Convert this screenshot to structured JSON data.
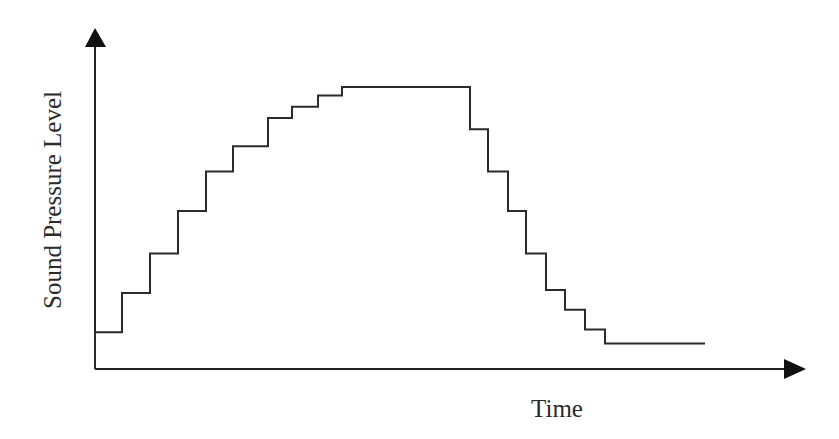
{
  "chart_data": {
    "type": "line",
    "subtype": "step",
    "title": "",
    "xlabel": "Time",
    "ylabel": "Sound Pressure Level",
    "grid": false,
    "legend": null,
    "ticks": {
      "x": [],
      "y": []
    },
    "units": "relative (0 = time axis, 10 = peak plateau)",
    "ylim": [
      0,
      11
    ],
    "series": [
      {
        "name": "Sound Pressure Level",
        "steps": [
          {
            "x_start": 95,
            "x_end": 122,
            "level": 1.3
          },
          {
            "x_start": 122,
            "x_end": 150,
            "level": 2.7
          },
          {
            "x_start": 150,
            "x_end": 178,
            "level": 4.1
          },
          {
            "x_start": 178,
            "x_end": 206,
            "level": 5.6
          },
          {
            "x_start": 206,
            "x_end": 233,
            "level": 7.0
          },
          {
            "x_start": 233,
            "x_end": 268,
            "level": 7.9
          },
          {
            "x_start": 268,
            "x_end": 292,
            "level": 8.9
          },
          {
            "x_start": 292,
            "x_end": 318,
            "level": 9.3
          },
          {
            "x_start": 318,
            "x_end": 342,
            "level": 9.7
          },
          {
            "x_start": 342,
            "x_end": 470,
            "level": 10.0
          },
          {
            "x_start": 470,
            "x_end": 488,
            "level": 8.5
          },
          {
            "x_start": 488,
            "x_end": 508,
            "level": 7.0
          },
          {
            "x_start": 508,
            "x_end": 526,
            "level": 5.6
          },
          {
            "x_start": 526,
            "x_end": 546,
            "level": 4.1
          },
          {
            "x_start": 546,
            "x_end": 565,
            "level": 2.8
          },
          {
            "x_start": 565,
            "x_end": 585,
            "level": 2.1
          },
          {
            "x_start": 585,
            "x_end": 605,
            "level": 1.4
          },
          {
            "x_start": 605,
            "x_end": 705,
            "level": 0.9
          }
        ]
      }
    ]
  },
  "colors": {
    "line": "#2b2b2b",
    "axis": "#222222",
    "background": "#ffffff"
  }
}
